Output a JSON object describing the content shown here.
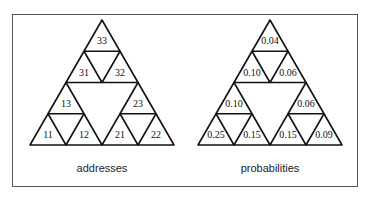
{
  "diagrams": [
    {
      "caption": "addresses",
      "cells": {
        "33": "33",
        "31": "31",
        "32": "32",
        "13": "13",
        "11": "11",
        "12": "12",
        "23": "23",
        "21": "21",
        "22": "22"
      }
    },
    {
      "caption": "probabilities",
      "cells": {
        "33": "0.04",
        "31": "0.10",
        "32": "0.06",
        "13": "0.10",
        "11": "0.25",
        "12": "0.15",
        "23": "0.06",
        "21": "0.15",
        "22": "0.09"
      }
    }
  ],
  "colors": {
    "stroke": "#111111",
    "frame": "#555555"
  }
}
